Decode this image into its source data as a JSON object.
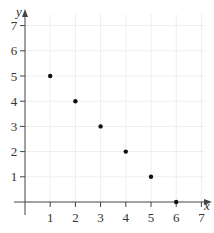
{
  "chart_data": {
    "type": "scatter",
    "title": "",
    "xlabel": "x",
    "ylabel": "y",
    "x": [
      1,
      2,
      3,
      4,
      5,
      6
    ],
    "y": [
      5,
      4,
      3,
      2,
      1,
      0
    ],
    "xlim": [
      0,
      7
    ],
    "ylim": [
      0,
      7
    ],
    "xticks": [
      1,
      2,
      3,
      4,
      5,
      6,
      7
    ],
    "yticks": [
      1,
      2,
      3,
      4,
      5,
      6,
      7
    ],
    "grid": true,
    "legend": null
  },
  "style": {
    "axis_color": "#444444",
    "grid_color": "#eeeeee",
    "point_color": "#111111"
  }
}
